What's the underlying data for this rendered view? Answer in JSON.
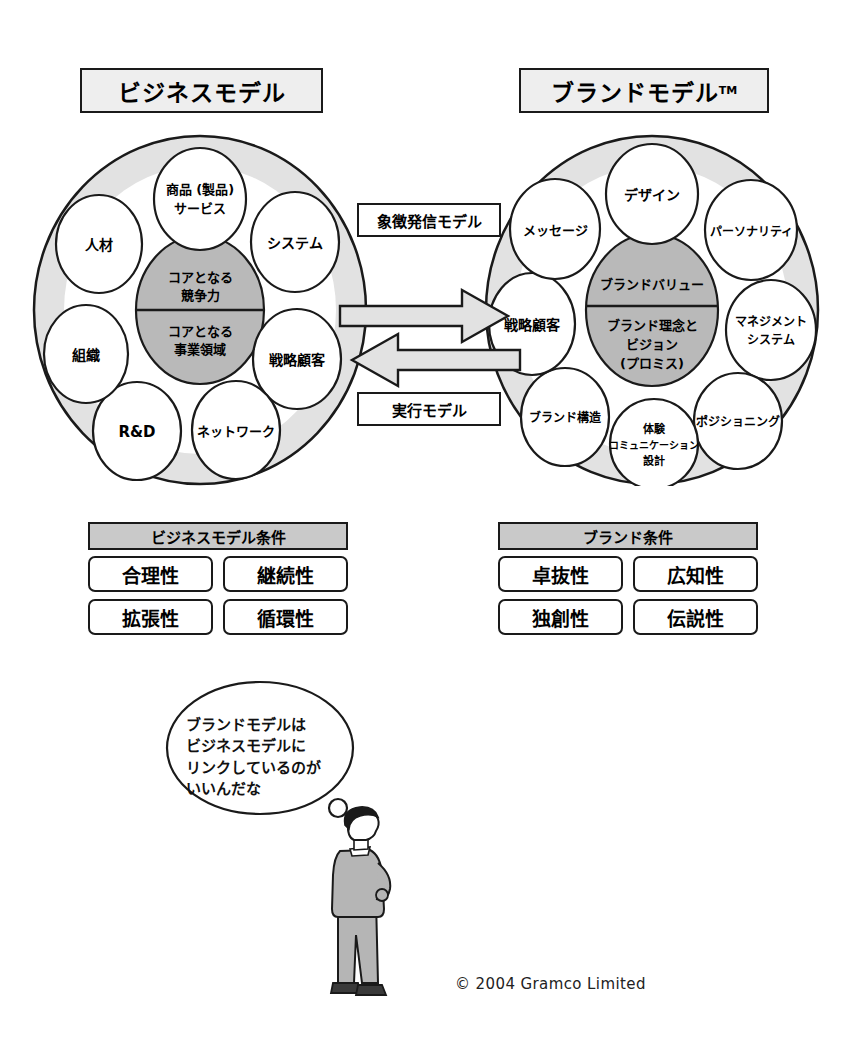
{
  "headers": {
    "left": "ビジネスモデル",
    "right": "ブランドモデル",
    "right_tm": "TM"
  },
  "business_model": {
    "core_top": "コアとなる\n競争力",
    "core_top_lines": [
      "コアとなる",
      "競争力"
    ],
    "core_bottom_lines": [
      "コアとなる",
      "事業領域"
    ],
    "nodes": [
      {
        "label": "商品 (製品)\nサービス",
        "lines": [
          "商品 (製品)",
          "サービス"
        ]
      },
      {
        "label": "システム",
        "lines": [
          "システム"
        ]
      },
      {
        "label": "戦略顧客",
        "lines": [
          "戦略顧客"
        ]
      },
      {
        "label": "ネットワーク",
        "lines": [
          "ネットワーク"
        ]
      },
      {
        "label": "R&D",
        "lines": [
          "R&D"
        ]
      },
      {
        "label": "組織",
        "lines": [
          "組織"
        ]
      },
      {
        "label": "人材",
        "lines": [
          "人材"
        ]
      }
    ]
  },
  "brand_model": {
    "core_top_lines": [
      "ブランドバリュー"
    ],
    "core_bottom_lines": [
      "ブランド理念と",
      "ビジョン",
      "(プロミス)"
    ],
    "nodes": [
      {
        "label": "デザイン",
        "lines": [
          "デザイン"
        ]
      },
      {
        "label": "パーソナリティ",
        "lines": [
          "パーソナリティ"
        ]
      },
      {
        "label": "マネジメント\nシステム",
        "lines": [
          "マネジメント",
          "システム"
        ]
      },
      {
        "label": "ポジショニング",
        "lines": [
          "ポジショニング"
        ]
      },
      {
        "label": "体験\nコミュニケーション\n設計",
        "lines": [
          "体験",
          "コミュニケーション",
          "設計"
        ]
      },
      {
        "label": "ブランド構造",
        "lines": [
          "ブランド構造"
        ]
      },
      {
        "label": "戦略顧客",
        "lines": [
          "戦略顧客"
        ]
      },
      {
        "label": "メッセージ",
        "lines": [
          "メッセージ"
        ]
      }
    ]
  },
  "arrows": {
    "top_label": "象徴発信モデル",
    "bottom_label": "実行モデル"
  },
  "conditions_left": {
    "title": "ビジネスモデル条件",
    "rows": [
      [
        "合理性",
        "継続性"
      ],
      [
        "拡張性",
        "循環性"
      ]
    ]
  },
  "conditions_right": {
    "title": "ブランド条件",
    "rows": [
      [
        "卓抜性",
        "広知性"
      ],
      [
        "独創性",
        "伝説性"
      ]
    ]
  },
  "thought": {
    "lines": [
      "ブランドモデルは",
      "ビジネスモデルに",
      "リンクしているのが",
      "いいんだな"
    ]
  },
  "footer": "© 2004 Gramco Limited",
  "colors": {
    "outline": "#1a1a1a",
    "ring_fill": "#e2e2e2",
    "inner_fill": "#ffffff",
    "core_fill": "#b9b9b9",
    "header_fill": "#eeeeee",
    "cond_title_fill": "#c9c9c9",
    "arrow_fill": "#e2e2e2",
    "suit_fill": "#b5b5b5"
  }
}
